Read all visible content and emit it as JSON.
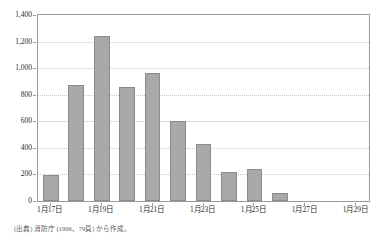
{
  "figure": {
    "title": "",
    "source_note": "(出典) 消防庁 (1996、79頁) から作成。"
  },
  "colors": {
    "bar_fill": "#a9a9a9",
    "bar_border": "#8b8b8b",
    "gridline": "#c9c9c9",
    "axis": "#9a9a9a",
    "text": "#2b2b2b"
  },
  "chart_data": {
    "type": "bar",
    "title": "",
    "xlabel": "",
    "ylabel": "",
    "ylim": [
      0,
      1400
    ],
    "ytick_labels": [
      "0",
      "200",
      "400",
      "600",
      "800",
      "1,000",
      "1,200",
      "1,400"
    ],
    "ytick_values": [
      0,
      200,
      400,
      600,
      800,
      1000,
      1200,
      1400
    ],
    "grid": true,
    "legend": false,
    "categories": [
      "1月17日",
      "1月18日",
      "1月19日",
      "1月20日",
      "1月21日",
      "1月22日",
      "1月23日",
      "1月24日",
      "1月25日",
      "1月26日",
      "1月27日",
      "1月28日",
      "1月29日"
    ],
    "xtick_labels": [
      "1月17日",
      "1月19日",
      "1月21日",
      "1月23日",
      "1月25日",
      "1月27日",
      "1月29日"
    ],
    "xtick_category_index": [
      0,
      2,
      4,
      6,
      8,
      10,
      12
    ],
    "values": [
      195,
      870,
      1240,
      860,
      965,
      600,
      430,
      215,
      240,
      60,
      0,
      0,
      0
    ]
  }
}
